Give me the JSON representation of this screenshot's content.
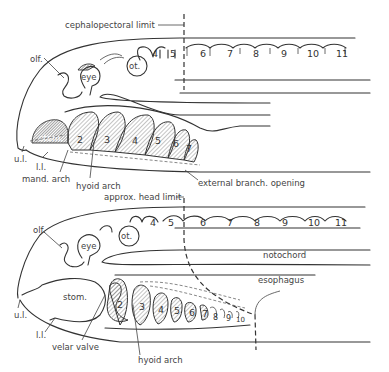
{
  "figure": {
    "top_panel": {
      "limit_label": "cephalopectoral limit",
      "labels": {
        "olf": "olf.",
        "eye": "eye",
        "ot": "ot.",
        "stom": "stom.",
        "ul": "u.l.",
        "ll": "l.l.",
        "mand_arch": "mand. arch",
        "hyoid_arch": "hyoid arch",
        "external_opening": "external branch. opening"
      },
      "somites": [
        "4",
        "5",
        "6",
        "7",
        "8",
        "9",
        "10",
        "11"
      ],
      "arches": [
        "2",
        "3",
        "4",
        "5",
        "6",
        "7"
      ]
    },
    "bottom_panel": {
      "limit_label": "approx. head limit",
      "labels": {
        "olf": "olf.",
        "eye": "eye",
        "ot": "ot.",
        "stom": "stom.",
        "ul": "u.l.",
        "ll": "l.l.",
        "velar_valve": "velar valve",
        "hyoid_arch": "hyoid arch",
        "notochord": "notochord",
        "esophagus": "esophagus"
      },
      "somites": [
        "4",
        "5",
        "6",
        "7",
        "8",
        "9",
        "10",
        "11"
      ],
      "arches": [
        "2",
        "3",
        "4",
        "5",
        "6",
        "7",
        "8",
        "9",
        "10"
      ]
    }
  }
}
